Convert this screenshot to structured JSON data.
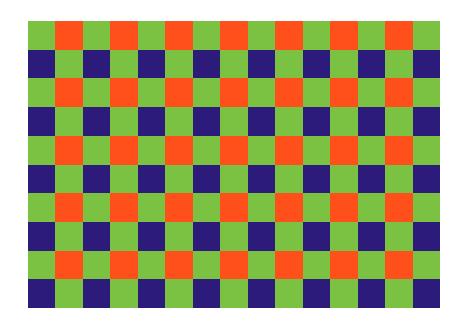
{
  "pattern": {
    "columns": 15,
    "rows": 10,
    "colors": {
      "G": "#7bc142",
      "O": "#ff501c",
      "B": "#2d1b7b"
    },
    "row_patterns": {
      "odd": "GOGOGOGOGOGOGOG",
      "even": "BGBGBGBGBGBGBGB"
    }
  }
}
